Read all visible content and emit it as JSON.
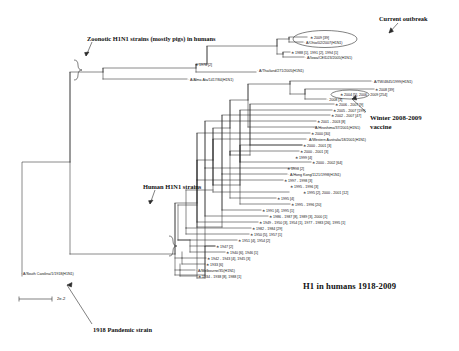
{
  "figure": {
    "title": "H1 in humans 1918-2009",
    "scale_bar_label": "2e-2"
  },
  "annotations": {
    "zoonotic": "Zoonotic H1N1 strains (mostly pigs) in humans",
    "current_outbreak": "Current outbreak",
    "winter_vaccine_line1": "Winter 2008-2009",
    "winter_vaccine_line2": "vaccine",
    "human_strains": "Human H1N1 strains",
    "pandemic_1918": "1918 Pandemic strain"
  },
  "chart_data": {
    "type": "tree",
    "title": "H1 in humans 1918-2009",
    "tree_type": "phylogenetic-rectangular-cladogram",
    "scale_bar": {
      "label": "2e-2",
      "value": 0.02,
      "units": "substitutions per site"
    },
    "groups": [
      {
        "name": "Zoonotic H1N1 strains (mostly pigs) in humans",
        "tip_labels": [
          "2009 [39]",
          "A/Ohio/02/2007(H1N1)",
          "1988 [1],  1991 [2],  1994 [1]",
          "A/Iowa/CEID23/2005(H1N1)",
          "1976 [2]",
          "A/Thailand/271/2005(H1N1)",
          "A/Alma Ata/1417/84(H1N1)"
        ]
      },
      {
        "name": "Human H1N1 strains",
        "tip_labels": [
          "A/TW/4845/1999(H1N1)",
          "2008 [39]",
          "2004 [5],  2006 - 2009 [254]",
          "2008 [3]",
          "2006 - 2007 [9]",
          "2005 - 2007 [199]",
          "2002 - 2007 [47]",
          "2001 - 2003 [8]",
          "A/Hiroshima/37/2001(H1N1)",
          "2000 [30]",
          "A/Western Australia/18/2001(H1N1)",
          "2000 - 2001 [3]",
          "2000 - 2001 [3]",
          "1999 [4]",
          "2000 - 2002 [64]",
          "1998 [2]",
          "A/Hong Kong/1121/1998(H1N1)",
          "1997 - 1998 [3]",
          "1995 - 1996 [3]",
          "1995 [2],  2000 - 2001 [12]",
          "1995 [4]",
          "1995 - 1996 [20]",
          "1991 [4],  1995 [1]",
          "1986 - 1987 [8],  1989 [3],  2000 [1]",
          "1949 - 1950 [3],  1954 [1],  1977 - 1983 [26],  1995 [1]",
          "1982 - 1984 [29]",
          "1950 [5],  1957 [1]",
          "1951 [4],  1954 [2]",
          "1947 [2]",
          "1940 [6],  1946 [1]",
          "1942 - 1943 [4],  1945 [3]",
          "1933 [6]",
          "A/Melbourne/35(H1N1)",
          "1934 - 1938 [8],  1988 [1]"
        ]
      },
      {
        "name": "1918 Pandemic strain",
        "tip_labels": [
          "A/South Carolina/1/1918(H1N1)"
        ]
      }
    ],
    "highlighted_clades": [
      {
        "label": "Current outbreak",
        "tips": [
          "2009 [39]",
          "A/Ohio/02/2007(H1N1)"
        ]
      },
      {
        "label": "Winter 2008-2009 vaccine",
        "tips": [
          "2004 [5],  2006 - 2009 [254]"
        ]
      }
    ]
  },
  "tips": [
    {
      "id": "t01",
      "text": "2009 [39]",
      "x": 310,
      "y": 38,
      "star": true
    },
    {
      "id": "t02",
      "text": "A/Ohio/02/2007(H1N1)",
      "x": 304,
      "y": 43,
      "star": false
    },
    {
      "id": "t03",
      "text": "1988 [1],  1991 [2],  1994 [1]",
      "x": 291,
      "y": 53,
      "star": true
    },
    {
      "id": "t04",
      "text": "A/Iowa/CEID23/2005(H1N1)",
      "x": 305,
      "y": 58,
      "star": false
    },
    {
      "id": "t05",
      "text": "1976 [2]",
      "x": 195,
      "y": 65,
      "star": true
    },
    {
      "id": "t06",
      "text": "A/Thailand/271/2005(H1N1)",
      "x": 257,
      "y": 71,
      "star": false
    },
    {
      "id": "t07",
      "text": "A/Alma Ata/1417/84(H1N1)",
      "x": 188,
      "y": 80,
      "star": false
    },
    {
      "id": "t08",
      "text": "A/TW/4845/1999(H1N1)",
      "x": 372,
      "y": 82,
      "star": false
    },
    {
      "id": "t09",
      "text": "2008 [39]",
      "x": 375,
      "y": 90,
      "star": true
    },
    {
      "id": "t10",
      "text": "2004 [5],  2006 - 2009 [254]",
      "x": 340,
      "y": 95,
      "star": true
    },
    {
      "id": "t11",
      "text": "2008 [3]",
      "x": 327,
      "y": 100,
      "star": false
    },
    {
      "id": "t12",
      "text": "2006 - 2007 [9]",
      "x": 335,
      "y": 105,
      "star": true
    },
    {
      "id": "t13",
      "text": "2005 - 2007 [199]",
      "x": 333,
      "y": 111,
      "star": true
    },
    {
      "id": "t14",
      "text": "2002 - 2007 [47]",
      "x": 331,
      "y": 116,
      "star": true
    },
    {
      "id": "t15",
      "text": "2001 - 2003 [8]",
      "x": 317,
      "y": 122,
      "star": true
    },
    {
      "id": "t16",
      "text": "A/Hiroshima/37/2001(H1N1)",
      "x": 313,
      "y": 128,
      "star": false
    },
    {
      "id": "t17",
      "text": "2000 [30]",
      "x": 311,
      "y": 134,
      "star": true
    },
    {
      "id": "t18",
      "text": "A/Western Australia/18/2001(H1N1)",
      "x": 307,
      "y": 140,
      "star": false
    },
    {
      "id": "t19",
      "text": "2000 - 2001 [3]",
      "x": 303,
      "y": 146,
      "star": true
    },
    {
      "id": "t20",
      "text": "2000 - 2001 [3]",
      "x": 300,
      "y": 152,
      "star": true
    },
    {
      "id": "t21",
      "text": "1999 [4]",
      "x": 295,
      "y": 158,
      "star": true
    },
    {
      "id": "t22",
      "text": "2000 - 2002 [64]",
      "x": 312,
      "y": 163,
      "star": true
    },
    {
      "id": "t23",
      "text": "1998 [2]",
      "x": 287,
      "y": 169,
      "star": true
    },
    {
      "id": "t24",
      "text": "A/Hong Kong/1121/1998(H1N1)",
      "x": 288,
      "y": 175,
      "star": false
    },
    {
      "id": "t25",
      "text": "1997 - 1998 [3]",
      "x": 284,
      "y": 181,
      "star": true
    },
    {
      "id": "t26",
      "text": "1995 - 1996 [3]",
      "x": 290,
      "y": 187,
      "star": true
    },
    {
      "id": "t27",
      "text": "1995 [2],  2000 - 2001 [12]",
      "x": 303,
      "y": 193,
      "star": true
    },
    {
      "id": "t28",
      "text": "1995 [4]",
      "x": 277,
      "y": 199,
      "star": true
    },
    {
      "id": "t29",
      "text": "1995 - 1996 [20]",
      "x": 291,
      "y": 205,
      "star": true
    },
    {
      "id": "t30",
      "text": "1991 [4],  1995 [1]",
      "x": 262,
      "y": 211,
      "star": true
    },
    {
      "id": "t31",
      "text": "1986 - 1987 [8],  1989 [3],  2000 [1]",
      "x": 269,
      "y": 217,
      "star": true
    },
    {
      "id": "t32",
      "text": "1949 - 1950 [3],  1954 [1],  1977 - 1983 [26],  1995 [1]",
      "x": 259,
      "y": 223,
      "star": true
    },
    {
      "id": "t33",
      "text": "1982 - 1984 [29]",
      "x": 252,
      "y": 229,
      "star": true
    },
    {
      "id": "t34",
      "text": "1950 [5],  1957 [1]",
      "x": 250,
      "y": 235,
      "star": true
    },
    {
      "id": "t35",
      "text": "1951 [4],  1954 [2]",
      "x": 238,
      "y": 241,
      "star": true
    },
    {
      "id": "t36",
      "text": "1947 [2]",
      "x": 216,
      "y": 247,
      "star": true
    },
    {
      "id": "t37",
      "text": "1940 [6],  1946 [1]",
      "x": 226,
      "y": 253,
      "star": true
    },
    {
      "id": "t38",
      "text": "1942 - 1943 [4],  1945 [3]",
      "x": 207,
      "y": 259,
      "star": true
    },
    {
      "id": "t39",
      "text": "1933 [6]",
      "x": 206,
      "y": 265,
      "star": true
    },
    {
      "id": "t40",
      "text": "A/Melbourne/35(H1N1)",
      "x": 196,
      "y": 271,
      "star": false
    },
    {
      "id": "t41",
      "text": "1934 - 1938 [8],  1988 [1]",
      "x": 198,
      "y": 277,
      "star": true
    },
    {
      "id": "t42",
      "text": "A/South Carolina/1/1918(H1N1)",
      "x": 21,
      "y": 274,
      "star": false
    }
  ]
}
